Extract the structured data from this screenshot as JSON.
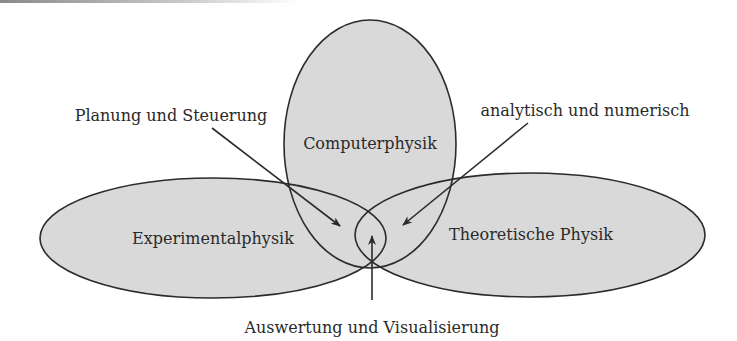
{
  "diagram": {
    "type": "venn",
    "colors": {
      "fill": "#d9d9d9",
      "stroke": "#2b2b2b",
      "text": "#2a2a2a",
      "background": "#ffffff"
    },
    "sets": [
      {
        "id": "computer",
        "label": "Computerphysik"
      },
      {
        "id": "experimental",
        "label": "Experimentalphysik"
      },
      {
        "id": "theoretical",
        "label": "Theoretische Physik"
      }
    ],
    "annotations": [
      {
        "id": "planning",
        "label": "Planung und Steuerung",
        "points_to": "Experimentalphysik ∩ Computerphysik"
      },
      {
        "id": "analytic",
        "label": "analytisch und numerisch",
        "points_to": "Theoretische Physik ∩ Computerphysik"
      },
      {
        "id": "evaluation",
        "label": "Auswertung und Visualisierung",
        "points_to": "Experimentalphysik ∩ Theoretische Physik"
      }
    ]
  }
}
